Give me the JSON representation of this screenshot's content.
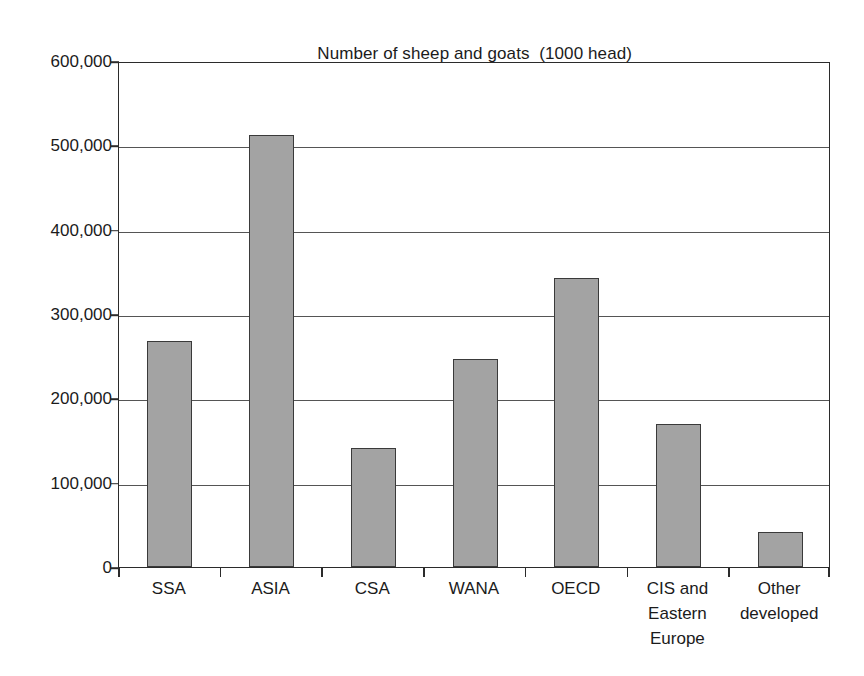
{
  "chart_data": {
    "type": "bar",
    "title": "Number of sheep and goats  (1000 head)",
    "xlabel": "",
    "ylabel": "",
    "ylim": [
      0,
      600000
    ],
    "ytick_step": 100000,
    "grid": true,
    "legend": "none",
    "bar_color": "#a3a3a3",
    "bar_edge_color": "#3a3a3a",
    "axis_color": "#2b2b2b",
    "categories": [
      "SSA",
      "ASIA",
      "CSA",
      "WANA",
      "OECD",
      "CIS and Eastern Europe",
      "Other developed"
    ],
    "category_lines": [
      [
        "SSA"
      ],
      [
        "ASIA"
      ],
      [
        "CSA"
      ],
      [
        "WANA"
      ],
      [
        "OECD"
      ],
      [
        "CIS and",
        "Eastern",
        "Europe"
      ],
      [
        "Other",
        "developed"
      ]
    ],
    "values": [
      268000,
      512000,
      141000,
      247000,
      343000,
      170000,
      41000
    ],
    "ytick_labels": [
      "600,000",
      "500,000",
      "400,000",
      "300,000",
      "200,000",
      "100,000",
      "0"
    ],
    "ytick_values": [
      600000,
      500000,
      400000,
      300000,
      200000,
      100000,
      0
    ]
  }
}
